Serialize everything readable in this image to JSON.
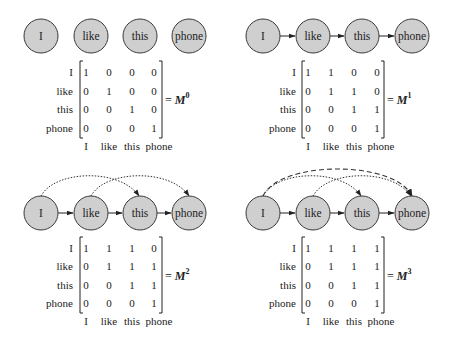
{
  "tokens": [
    "I",
    "like",
    "this",
    "phone"
  ],
  "panels": [
    {
      "id": "m0",
      "equation_prefix": "= ",
      "matrix_symbol": "M",
      "power": "0",
      "row_labels": [
        "I",
        "like",
        "this",
        "phone"
      ],
      "col_labels": [
        "I",
        "like",
        "this",
        "phone"
      ],
      "matrix": [
        [
          "1",
          "0",
          "0",
          "0"
        ],
        [
          "0",
          "1",
          "0",
          "0"
        ],
        [
          "0",
          "0",
          "1",
          "0"
        ],
        [
          "0",
          "0",
          "0",
          "1"
        ]
      ],
      "edges": []
    },
    {
      "id": "m1",
      "equation_prefix": "= ",
      "matrix_symbol": "M",
      "power": "1",
      "row_labels": [
        "I",
        "like",
        "this",
        "phone"
      ],
      "col_labels": [
        "I",
        "like",
        "this",
        "phone"
      ],
      "matrix": [
        [
          "1",
          "1",
          "0",
          "0"
        ],
        [
          "0",
          "1",
          "1",
          "0"
        ],
        [
          "0",
          "0",
          "1",
          "1"
        ],
        [
          "0",
          "0",
          "0",
          "1"
        ]
      ],
      "edges": [
        {
          "from": "I",
          "to": "like",
          "style": "solid"
        },
        {
          "from": "like",
          "to": "this",
          "style": "solid"
        },
        {
          "from": "this",
          "to": "phone",
          "style": "solid"
        }
      ]
    },
    {
      "id": "m2",
      "equation_prefix": "= ",
      "matrix_symbol": "M",
      "power": "2",
      "row_labels": [
        "I",
        "like",
        "this",
        "phone"
      ],
      "col_labels": [
        "I",
        "like",
        "this",
        "phone"
      ],
      "matrix": [
        [
          "1",
          "1",
          "1",
          "0"
        ],
        [
          "0",
          "1",
          "1",
          "1"
        ],
        [
          "0",
          "0",
          "1",
          "1"
        ],
        [
          "0",
          "0",
          "0",
          "1"
        ]
      ],
      "edges": [
        {
          "from": "I",
          "to": "like",
          "style": "solid"
        },
        {
          "from": "like",
          "to": "this",
          "style": "solid"
        },
        {
          "from": "this",
          "to": "phone",
          "style": "solid"
        },
        {
          "from": "I",
          "to": "this",
          "style": "dotted"
        },
        {
          "from": "like",
          "to": "phone",
          "style": "dotted"
        }
      ]
    },
    {
      "id": "m3",
      "equation_prefix": "= ",
      "matrix_symbol": "M",
      "power": "3",
      "row_labels": [
        "I",
        "like",
        "this",
        "phone"
      ],
      "col_labels": [
        "I",
        "like",
        "this",
        "phone"
      ],
      "matrix": [
        [
          "1",
          "1",
          "1",
          "1"
        ],
        [
          "0",
          "1",
          "1",
          "1"
        ],
        [
          "0",
          "0",
          "1",
          "1"
        ],
        [
          "0",
          "0",
          "0",
          "1"
        ]
      ],
      "edges": [
        {
          "from": "I",
          "to": "like",
          "style": "solid"
        },
        {
          "from": "like",
          "to": "this",
          "style": "solid"
        },
        {
          "from": "this",
          "to": "phone",
          "style": "solid"
        },
        {
          "from": "I",
          "to": "this",
          "style": "dotted"
        },
        {
          "from": "like",
          "to": "phone",
          "style": "dotted"
        },
        {
          "from": "I",
          "to": "phone",
          "style": "dashed"
        }
      ]
    }
  ],
  "colors": {
    "node_fill": "#cfcfcf",
    "node_stroke": "#3a3a3a",
    "text": "#222222"
  }
}
